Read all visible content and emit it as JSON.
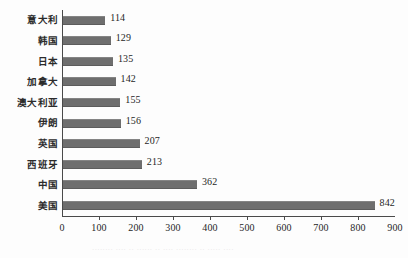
{
  "chart_data": {
    "type": "bar",
    "orientation": "horizontal",
    "title": "",
    "xlabel": "",
    "ylabel": "",
    "xlim": [
      0,
      900
    ],
    "xticks": [
      0,
      100,
      200,
      300,
      400,
      500,
      600,
      700,
      800,
      900
    ],
    "grid": false,
    "legend": null,
    "bar_color": "#6e6e6e",
    "axis_color": "#4a4a4a",
    "text_color": "#1f1f1f",
    "categories": [
      "意大利",
      "韩国",
      "日本",
      "加拿大",
      "澳大利亚",
      "伊朗",
      "英国",
      "西班牙",
      "中国",
      "美国"
    ],
    "values": [
      114,
      129,
      135,
      142,
      155,
      156,
      207,
      213,
      362,
      842
    ],
    "data_labels": [
      "114",
      "129",
      "135",
      "142",
      "155",
      "156",
      "207",
      "213",
      "362",
      "842"
    ],
    "tick_labels": [
      "0",
      "100",
      "200",
      "300",
      "400",
      "500",
      "600",
      "700",
      "800",
      "900"
    ]
  },
  "caption": {
    "bottom_partial": "········ ···· ·· ······ ·· ···· ········ ·· ····· ····"
  }
}
